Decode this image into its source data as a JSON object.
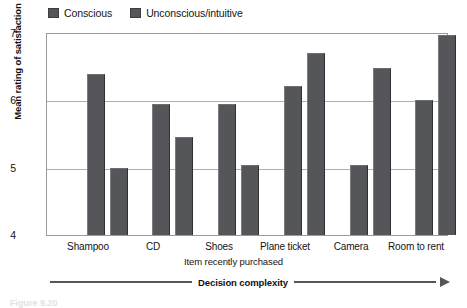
{
  "chart_data": {
    "type": "bar",
    "title": "",
    "xlabel": "Item recently purchased",
    "ylabel": "Mean rating of satisfaction",
    "ylim": [
      4,
      7
    ],
    "yticks": [
      "4",
      "5",
      "6",
      "7"
    ],
    "grid": true,
    "legend_position": "top-left",
    "categories": [
      "Shampoo",
      "CD",
      "Shoes",
      "Plane ticket",
      "Camera",
      "Room to rent"
    ],
    "series": [
      {
        "name": "Conscious",
        "color": "#55565a",
        "values": [
          6.4,
          5.95,
          5.95,
          6.22,
          5.05,
          6.02
        ]
      },
      {
        "name": "Unconscious/intuitive",
        "color": "#55565a",
        "values": [
          5.0,
          5.47,
          5.05,
          6.72,
          6.5,
          6.98
        ]
      }
    ],
    "annotations": [
      {
        "text": "Decision complexity",
        "type": "arrow",
        "direction": "right"
      }
    ]
  },
  "legend": {
    "items": [
      {
        "label": "Conscious"
      },
      {
        "label": "Unconscious/intuitive"
      }
    ]
  },
  "axes": {
    "y": {
      "title": "Mean rating of satisfaction",
      "ticks": [
        "7",
        "6",
        "5",
        "4"
      ]
    },
    "x": {
      "title": "Item recently purchased",
      "ticks": [
        "Shampoo",
        "CD",
        "Shoes",
        "Plane ticket",
        "Camera",
        "Room to rent"
      ]
    }
  },
  "annotation": {
    "complexity_label": "Decision complexity"
  },
  "caption": {
    "text": "Figure 9.20"
  }
}
